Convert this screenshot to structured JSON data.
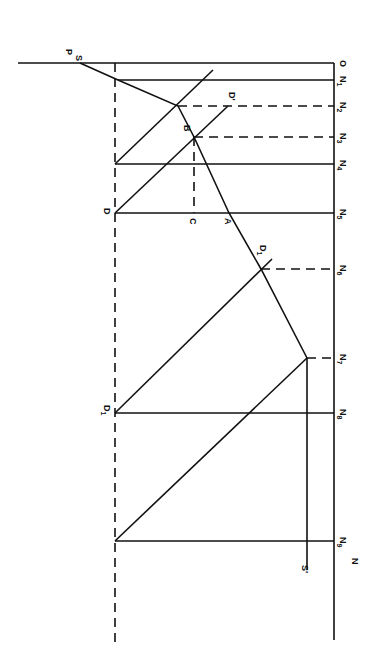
{
  "diagram": {
    "type": "geometric construction (rotated 90°)",
    "stroke_color": "#111111",
    "background": "#ffffff",
    "axis_labels": {
      "origin": "O",
      "price": "P",
      "quantity": "N"
    },
    "ticks": [
      {
        "label": "N",
        "sub": "1",
        "y": 80,
        "style": "solid"
      },
      {
        "label": "N",
        "sub": "2",
        "y": 106,
        "style": "dashed"
      },
      {
        "label": "N",
        "sub": "3",
        "y": 137,
        "style": "dashed"
      },
      {
        "label": "N",
        "sub": "4",
        "y": 164,
        "style": "solid"
      },
      {
        "label": "N",
        "sub": "5",
        "y": 213,
        "style": "solid"
      },
      {
        "label": "N",
        "sub": "6",
        "y": 269,
        "style": "dashed"
      },
      {
        "label": "N",
        "sub": "7",
        "y": 358,
        "style": "dashed"
      },
      {
        "label": "N",
        "sub": "8",
        "y": 413,
        "style": "solid"
      },
      {
        "label": "N",
        "sub": "9",
        "y": 541,
        "style": "solid"
      }
    ],
    "points": {
      "S": "S",
      "S_prime": "S'",
      "D": "D",
      "D_prime": "D'",
      "D1": "D",
      "D1_sub": "1",
      "D1_prime": "D",
      "D1_prime_sub": "1",
      "B": "B",
      "C": "C",
      "A": "A"
    }
  }
}
